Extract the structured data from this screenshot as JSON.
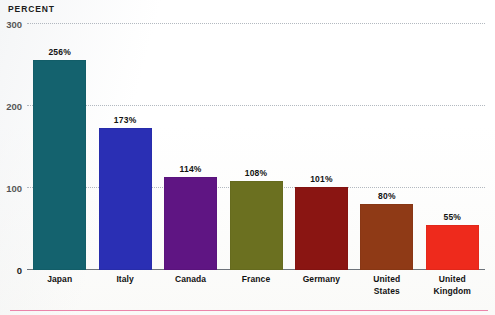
{
  "chart_data": {
    "type": "bar",
    "title": "",
    "ylabel": "PERCENT",
    "xlabel": "",
    "ylim": [
      0,
      300
    ],
    "yticks": [
      0,
      100,
      200,
      300
    ],
    "ytick_labels": [
      "0",
      "100",
      "200",
      "300"
    ],
    "grid": true,
    "legend": "none",
    "categories": [
      "Japan",
      "Italy",
      "Canada",
      "France",
      "Germany",
      "United States",
      "United Kingdom"
    ],
    "category_lines": [
      [
        "Japan"
      ],
      [
        "Italy"
      ],
      [
        "Canada"
      ],
      [
        "France"
      ],
      [
        "Germany"
      ],
      [
        "United",
        "States"
      ],
      [
        "United",
        "Kingdom"
      ]
    ],
    "values": [
      256,
      173,
      114,
      108,
      101,
      80,
      55
    ],
    "value_labels": [
      "256%",
      "173%",
      "114%",
      "108%",
      "101%",
      "80%",
      "55%"
    ],
    "colors": [
      "#14626e",
      "#2a2fb4",
      "#5f1583",
      "#6b7020",
      "#8a1512",
      "#8f3a16",
      "#ee2a1c"
    ]
  },
  "decoration": {
    "bottom_rule_color": "#e8709c"
  }
}
